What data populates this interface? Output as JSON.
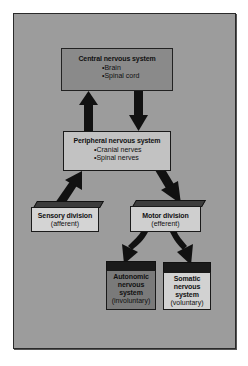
{
  "diagram": {
    "colors": {
      "frame_bg": "#9c9c9c",
      "cns_fill": "#8a8a8a",
      "pns_fill": "#c2c2c2",
      "sensory_fill": "#d4d4d4",
      "motor_fill": "#cfcfcf",
      "autonomic_fill": "#7a7a7a",
      "somatic_fill": "#d2d2d2",
      "arrow": "#111111"
    },
    "cns": {
      "title": "Central nervous system",
      "items": [
        "Brain",
        "Spinal cord"
      ]
    },
    "pns": {
      "title": "Peripheral nervous system",
      "items": [
        "Cranial nerves",
        "Spinal nerves"
      ]
    },
    "sensory": {
      "title": "Sensory division",
      "sub": "(afferent)"
    },
    "motor": {
      "title": "Motor division",
      "sub": "(efferent)"
    },
    "autonomic": {
      "line1": "Autonomic",
      "line2": "nervous",
      "line3": "system",
      "sub": "(involuntary)"
    },
    "somatic": {
      "line1": "Somatic",
      "line2": "nervous",
      "line3": "system",
      "sub": "(voluntary)"
    },
    "connections": [
      {
        "from": "pns",
        "to": "cns",
        "direction": "up"
      },
      {
        "from": "cns",
        "to": "pns",
        "direction": "down"
      },
      {
        "from": "sensory",
        "to": "pns",
        "direction": "up-right"
      },
      {
        "from": "pns",
        "to": "motor",
        "direction": "down-right"
      },
      {
        "from": "motor",
        "to": "autonomic",
        "direction": "down-left"
      },
      {
        "from": "motor",
        "to": "somatic",
        "direction": "down-right"
      }
    ]
  }
}
